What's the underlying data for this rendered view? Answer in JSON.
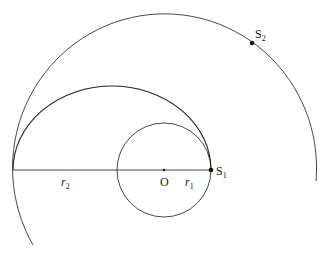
{
  "diagram": {
    "labels": {
      "center": "O",
      "r1": "r",
      "r1_sub": "1",
      "r2": "r",
      "r2_sub": "2",
      "s1": "S",
      "s1_sub": "1",
      "s2": "S",
      "s2_sub": "2"
    },
    "colors": {
      "line": "#333333",
      "background": "#ffffff"
    }
  }
}
